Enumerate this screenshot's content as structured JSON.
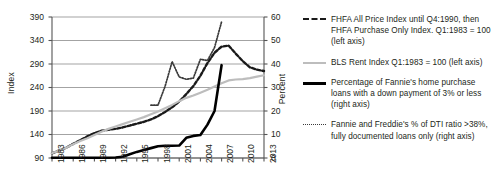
{
  "chart_data": {
    "type": "line",
    "title": "",
    "xlabel": "",
    "ylabel": "Index",
    "ylabel_right": "Percent",
    "grid": true,
    "legend_position": "right",
    "xlim": [
      1983,
      2013
    ],
    "ylim": [
      90,
      390
    ],
    "ylim_right": [
      0,
      60
    ],
    "xticks": [
      "1983",
      "1986",
      "1989",
      "1992",
      "1995",
      "1998",
      "2001",
      "2004",
      "2007",
      "2010",
      "2013"
    ],
    "yticks_left": [
      "90",
      "140",
      "190",
      "240",
      "290",
      "340",
      "390"
    ],
    "yticks_right": [
      "0",
      "10",
      "20",
      "30",
      "40",
      "50",
      "60"
    ],
    "series": [
      {
        "name": "FHFA All Price Index until Q4:1990, then FHFA Purchase Only Index. Q1:1983 = 100 (left axis)",
        "short_name": "fhfa-price-index",
        "axis": "left",
        "style": "dashed",
        "color": "#1a1a1a",
        "x": [
          1983,
          1984,
          1985,
          1986,
          1987,
          1988,
          1989,
          1990,
          1991,
          1992,
          1993,
          1994,
          1995,
          1996,
          1997,
          1998,
          1999,
          2000,
          2001,
          2002,
          2003,
          2004,
          2005,
          2006,
          2007,
          2008,
          2009,
          2010,
          2011,
          2012,
          2013
        ],
        "values": [
          100,
          106,
          112,
          120,
          128,
          136,
          143,
          148,
          150,
          152,
          155,
          159,
          163,
          167,
          172,
          179,
          188,
          198,
          210,
          226,
          243,
          265,
          292,
          314,
          327,
          329,
          312,
          296,
          283,
          278,
          275
        ]
      },
      {
        "name": "BLS Rent Index Q1:1983 = 100 (left axis)",
        "short_name": "bls-rent-index",
        "axis": "left",
        "style": "solid",
        "color": "#bdbdbd",
        "x": [
          1983,
          1984,
          1985,
          1986,
          1987,
          1988,
          1989,
          1990,
          1991,
          1992,
          1993,
          1994,
          1995,
          1996,
          1997,
          1998,
          1999,
          2000,
          2001,
          2002,
          2003,
          2004,
          2005,
          2006,
          2007,
          2008,
          2009,
          2010,
          2011,
          2012,
          2013
        ],
        "values": [
          100,
          106,
          112,
          119,
          126,
          132,
          139,
          146,
          152,
          157,
          162,
          167,
          172,
          177,
          183,
          189,
          196,
          203,
          211,
          218,
          223,
          229,
          235,
          242,
          249,
          255,
          257,
          258,
          260,
          263,
          266
        ]
      },
      {
        "name": "Percentage of Fannie's home purchase loans with a down payment of 3% or less (right axis)",
        "short_name": "fannie-low-downpayment-share",
        "axis": "right",
        "style": "solid-thick",
        "color": "#000000",
        "unit": "percent",
        "x": [
          1983,
          1984,
          1985,
          1986,
          1987,
          1988,
          1989,
          1990,
          1991,
          1992,
          1993,
          1994,
          1995,
          1996,
          1997,
          1998,
          1999,
          2000,
          2001,
          2002,
          2003,
          2004,
          2005,
          2006,
          2007
        ],
        "values": [
          0.1,
          0.1,
          0.1,
          0.1,
          0.1,
          0.1,
          0.1,
          0.1,
          0.1,
          0.2,
          0.5,
          1.6,
          2.6,
          3.4,
          4.2,
          5.0,
          5.2,
          5.2,
          5.3,
          8.6,
          9.4,
          9.8,
          14.2,
          20.0,
          39.5
        ]
      },
      {
        "name": "Fannie and Freddie's % of DTI ratio >38%, fully documented loans only (right axis)",
        "short_name": "fannie-freddie-dti-over-38",
        "axis": "right",
        "style": "dotted",
        "color": "#3a3a3a",
        "unit": "percent",
        "x": [
          1997,
          1998,
          1999,
          2000,
          2001,
          2002,
          2003,
          2004,
          2005,
          2006,
          2007
        ],
        "values": [
          22.5,
          22.5,
          30.5,
          41.0,
          34.5,
          33.5,
          34.0,
          42.0,
          41.5,
          47.0,
          58.0
        ]
      }
    ]
  },
  "axes": {
    "left_title": "Index",
    "right_title": "Percent"
  },
  "legend": {
    "entries": [
      {
        "id": "fhfa-price-index",
        "swatch": "dashed-line-swatch",
        "text": "FHFA All Price Index until Q4:1990, then FHFA Purchase Only Index. Q1:1983 = 100 (left axis)"
      },
      {
        "id": "bls-rent-index",
        "swatch": "gray-line-swatch",
        "text": "BLS Rent Index Q1:1983 = 100 (left axis)"
      },
      {
        "id": "fannie-low-downpayment-share",
        "swatch": "black-line-swatch",
        "text": "Percentage of Fannie's home purchase loans with a down payment of 3% or less (right axis)"
      },
      {
        "id": "fannie-freddie-dti-over-38",
        "swatch": "dotted-line-swatch",
        "text": "Fannie and Freddie's % of DTI ratio >38%, fully documented loans only (right axis)"
      }
    ]
  }
}
